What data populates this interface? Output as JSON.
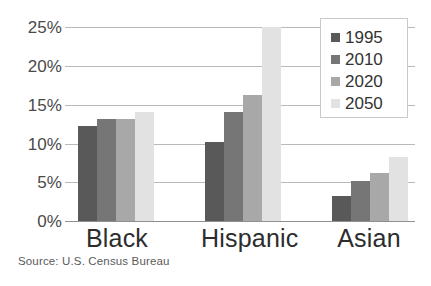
{
  "chart_data": {
    "type": "bar",
    "title": "",
    "subtitle": "",
    "xlabel": "",
    "ylabel": "",
    "categories": [
      "Black",
      "Hispanic",
      "Asian"
    ],
    "series": [
      {
        "name": "1995",
        "color": "#595959",
        "values": [
          12.2,
          10.2,
          3.2
        ]
      },
      {
        "name": "2010",
        "color": "#767676",
        "values": [
          13.2,
          14.1,
          5.2
        ]
      },
      {
        "name": "2020",
        "color": "#a8a8a8",
        "values": [
          13.2,
          16.2,
          6.2
        ]
      },
      {
        "name": "2050",
        "color": "#e2e2e2",
        "values": [
          14.1,
          25.0,
          8.3
        ]
      }
    ],
    "ylim": [
      0,
      25
    ],
    "ytick_values": [
      0,
      5,
      10,
      15,
      20,
      25
    ],
    "ytick_labels": [
      "0%",
      "5%",
      "10%",
      "15%",
      "20%",
      "25%"
    ],
    "grid": true,
    "legend_position": "top-right",
    "annotations": [
      "Source: U.S. Census Bureau"
    ]
  },
  "axis": {
    "y_ticks": [
      {
        "label": "25%",
        "value": 25
      },
      {
        "label": "20%",
        "value": 20
      },
      {
        "label": "15%",
        "value": 15
      },
      {
        "label": "10%",
        "value": 10
      },
      {
        "label": "5%",
        "value": 5
      },
      {
        "label": "0%",
        "value": 0
      }
    ]
  },
  "legend": {
    "entries": [
      {
        "label": "1995",
        "color": "#595959"
      },
      {
        "label": "2010",
        "color": "#767676"
      },
      {
        "label": "2020",
        "color": "#a8a8a8"
      },
      {
        "label": "2050",
        "color": "#e2e2e2"
      }
    ]
  },
  "footer": {
    "source": "Source: U.S. Census Bureau"
  },
  "colors": {
    "gridline": "#b9b9b9",
    "axis": "#8f8f8f",
    "tick_text": "#4a4a4a",
    "category_text": "#2d2d2d",
    "legend_border": "#c9c9c9",
    "background": "#ffffff"
  }
}
